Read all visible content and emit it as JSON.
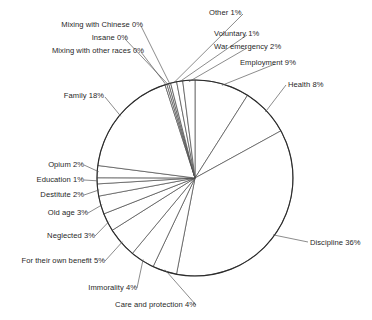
{
  "chart_data": {
    "type": "pie",
    "title": "",
    "subtitle": "",
    "xlabel": "",
    "ylabel": "",
    "legend_position": "none",
    "grid": false,
    "labels_show_percent": true,
    "start_angle_deg": 0,
    "direction": "clockwise",
    "categories": [
      "Employment",
      "Health",
      "Discipline",
      "Care and protection",
      "Immorality",
      "For their own benefit",
      "Neglected",
      "Old age",
      "Destitute",
      "Education",
      "Opium",
      "Family",
      "Mixing with other races",
      "Insane",
      "Mixing with Chinese",
      "Other",
      "Voluntary",
      "War emergency"
    ],
    "values": [
      9,
      8,
      36,
      4,
      4,
      5,
      3,
      3,
      2,
      1,
      2,
      18,
      0,
      0,
      0,
      1,
      1,
      2
    ],
    "units": "percent",
    "slices": [
      {
        "label": "Employment",
        "value": 9,
        "text": "Employment 9%"
      },
      {
        "label": "Health",
        "value": 8,
        "text": "Health 8%"
      },
      {
        "label": "Discipline",
        "value": 36,
        "text": "Discipline 36%"
      },
      {
        "label": "Care and protection",
        "value": 4,
        "text": "Care and protection 4%"
      },
      {
        "label": "Immorality",
        "value": 4,
        "text": "Immorality 4%"
      },
      {
        "label": "For their own benefit",
        "value": 5,
        "text": "For their own benefit 5%"
      },
      {
        "label": "Neglected",
        "value": 3,
        "text": "Neglected 3%"
      },
      {
        "label": "Old age",
        "value": 3,
        "text": "Old age 3%"
      },
      {
        "label": "Destitute",
        "value": 2,
        "text": "Destitute 2%"
      },
      {
        "label": "Education",
        "value": 1,
        "text": "Education 1%"
      },
      {
        "label": "Opium",
        "value": 2,
        "text": "Opium 2%"
      },
      {
        "label": "Family",
        "value": 18,
        "text": "Family 18%"
      },
      {
        "label": "Mixing with other races",
        "value": 0,
        "text": "Mixing with other races 0%"
      },
      {
        "label": "Insane",
        "value": 0,
        "text": "Insane 0%"
      },
      {
        "label": "Mixing with Chinese",
        "value": 0,
        "text": "Mixing with Chinese 0%"
      },
      {
        "label": "Other",
        "value": 1,
        "text": "Other 1%"
      },
      {
        "label": "Voluntary",
        "value": 1,
        "text": "Voluntary 1%"
      },
      {
        "label": "War emergency",
        "value": 2,
        "text": "War emergency 2%"
      }
    ],
    "colors": {
      "slice_fill": "#ffffff",
      "slice_stroke": "#4a4a4a",
      "outline": "#2b2b2b",
      "leader": "#5a5a5a",
      "text": "#1f1f1f",
      "background": "#ffffff"
    },
    "geometry": {
      "center_x": 195,
      "center_y": 178,
      "radius": 98
    }
  },
  "labels": {
    "employment": "Employment 9%",
    "health": "Health 8%",
    "discipline": "Discipline 36%",
    "care_and_protection": "Care and protection 4%",
    "immorality": "Immorality 4%",
    "for_their_own_benefit": "For their own benefit 5%",
    "neglected": "Neglected 3%",
    "old_age": "Old age 3%",
    "destitute": "Destitute 2%",
    "education": "Education 1%",
    "opium": "Opium 2%",
    "family": "Family 18%",
    "mixing_with_other_races": "Mixing with other races 0%",
    "insane": "Insane 0%",
    "mixing_with_chinese": "Mixing with Chinese 0%",
    "other": "Other 1%",
    "voluntary": "Voluntary 1%",
    "war_emergency": "War emergency 2%"
  }
}
